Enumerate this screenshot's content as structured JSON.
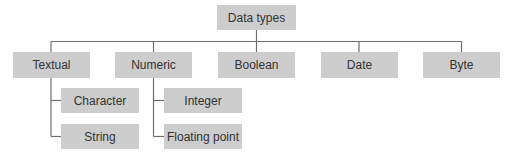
{
  "diagram": {
    "root": {
      "label": "Data types"
    },
    "categories": [
      {
        "label": "Textual",
        "children": [
          {
            "label": "Character"
          },
          {
            "label": "String"
          }
        ]
      },
      {
        "label": "Numeric",
        "children": [
          {
            "label": "Integer"
          },
          {
            "label": "Floating point"
          }
        ]
      },
      {
        "label": "Boolean",
        "children": []
      },
      {
        "label": "Date",
        "children": []
      },
      {
        "label": "Byte",
        "children": []
      }
    ],
    "colors": {
      "box_fill": "#cdcdcd",
      "line": "#6f6f6f",
      "text": "#333333"
    }
  }
}
